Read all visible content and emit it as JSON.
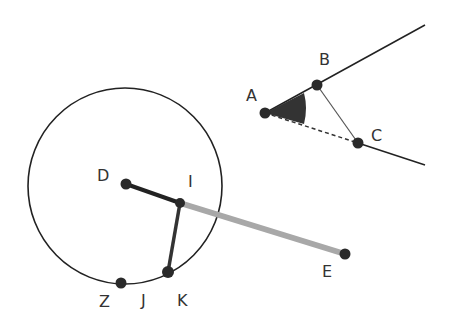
{
  "diagram": {
    "type": "geometry-construction",
    "colors": {
      "stroke": "#222222",
      "point": "#2a2a2a",
      "highlight_segment": "#a8a8a8",
      "angle_fill": "#333333",
      "label": "#333333"
    },
    "points": [
      {
        "id": "A",
        "label": "A",
        "x": 265,
        "y": 113
      },
      {
        "id": "B",
        "label": "B",
        "x": 317,
        "y": 85
      },
      {
        "id": "C",
        "label": "C",
        "x": 358,
        "y": 143
      },
      {
        "id": "D",
        "label": "D",
        "x": 126,
        "y": 184
      },
      {
        "id": "I",
        "label": "I",
        "x": 180,
        "y": 203
      },
      {
        "id": "K",
        "label": "K",
        "x": 168,
        "y": 272
      },
      {
        "id": "Z",
        "label": "Z",
        "x": 121,
        "y": 283
      },
      {
        "id": "E",
        "label": "E",
        "x": 345,
        "y": 254
      }
    ],
    "labels": {
      "A": "A",
      "B": "B",
      "C": "C",
      "D": "D",
      "I": "I",
      "E": "E",
      "Z": "Z",
      "J": "J",
      "K": "K"
    },
    "elements": [
      {
        "kind": "circle",
        "center": [
          125,
          186
        ],
        "radius": 97
      },
      {
        "kind": "ray",
        "from": "A",
        "through": "B"
      },
      {
        "kind": "ray",
        "from": "C",
        "direction": "away-from-A"
      },
      {
        "kind": "dashed-segment",
        "from": "A",
        "to": "C"
      },
      {
        "kind": "segment",
        "from": "B",
        "to": "C"
      },
      {
        "kind": "angle-marker",
        "vertex": "A",
        "filled": true
      },
      {
        "kind": "thick-segment",
        "from": "D",
        "to": "I"
      },
      {
        "kind": "thick-segment",
        "from": "I",
        "to": "K"
      },
      {
        "kind": "highlight-segment",
        "from": "I",
        "to": "E"
      }
    ]
  }
}
